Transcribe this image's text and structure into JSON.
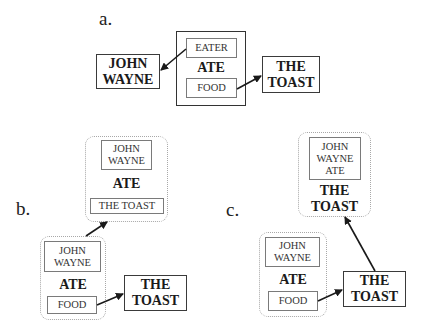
{
  "panels": {
    "a": {
      "label": "a.",
      "agent": "JOHN\nWAYNE",
      "frame": {
        "head": "ATE",
        "slots": [
          "EATER",
          "FOOD"
        ]
      },
      "object": "THE\nTOAST"
    },
    "b": {
      "label": "b.",
      "result_frame": {
        "slot_top": "JOHN\nWAYNE",
        "head": "ATE",
        "slot_bottom": "THE TOAST"
      },
      "source_frame": {
        "slot_top": "JOHN\nWAYNE",
        "head": "ATE",
        "slot_bottom": "FOOD"
      },
      "object": "THE\nTOAST"
    },
    "c": {
      "label": "c.",
      "result_frame": {
        "slot_top": "JOHN\nWAYNE\nATE",
        "head": "THE\nTOAST"
      },
      "source_frame": {
        "slot_top": "JOHN\nWAYNE",
        "head": "ATE",
        "slot_bottom": "FOOD"
      },
      "object": "THE\nTOAST"
    }
  },
  "colors": {
    "line": "#1a1a1a",
    "dashed_border": "#a8a8a8",
    "thin_border": "#7a7a7a"
  }
}
